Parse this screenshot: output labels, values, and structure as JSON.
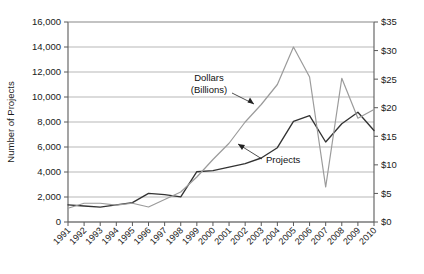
{
  "chart_data": {
    "type": "line",
    "title": "",
    "xlabel": "",
    "ylabel": "Number of Projects",
    "y2label": "",
    "grid": true,
    "legend_position": "inline-annotations",
    "x": [
      1991,
      1992,
      1993,
      1994,
      1995,
      1996,
      1997,
      1998,
      1999,
      2000,
      2001,
      2002,
      2003,
      2004,
      2005,
      2006,
      2007,
      2008,
      2009,
      2010
    ],
    "xtick_labels": [
      "1991",
      "1992",
      "1993",
      "1994",
      "1995",
      "1996",
      "1997",
      "1998",
      "1999",
      "2000",
      "2001",
      "2002",
      "2003",
      "2004",
      "2005",
      "2006",
      "2007",
      "2008",
      "2009",
      "2010"
    ],
    "ylim": [
      0,
      16000
    ],
    "ytick_labels": [
      "0",
      "2,000",
      "4,000",
      "6,000",
      "8,000",
      "10,000",
      "12,000",
      "14,000",
      "16,000"
    ],
    "ytick_values": [
      0,
      2000,
      4000,
      6000,
      8000,
      10000,
      12000,
      14000,
      16000
    ],
    "y2lim": [
      0,
      35
    ],
    "y2tick_labels": [
      "$0",
      "$5",
      "$10",
      "$15",
      "$20",
      "$25",
      "$30",
      "$35"
    ],
    "y2tick_values": [
      0,
      5,
      10,
      15,
      20,
      25,
      30,
      35
    ],
    "series": [
      {
        "name": "Dollars (Billions)",
        "axis": "right",
        "color": "#333333",
        "values": [
          3.0,
          2.8,
          2.6,
          3.0,
          3.4,
          5.0,
          4.8,
          4.4,
          8.8,
          9.0,
          9.6,
          10.2,
          11.2,
          13.0,
          17.6,
          18.6,
          14.0,
          17.2,
          19.2,
          16.0
        ]
      },
      {
        "name": "Projects",
        "axis": "left",
        "color": "#9b9b9b",
        "values": [
          1100,
          1500,
          1500,
          1350,
          1500,
          1200,
          1800,
          2400,
          3600,
          5000,
          6300,
          8000,
          9400,
          11000,
          14000,
          11600,
          2800,
          11500,
          8300,
          9000
        ]
      }
    ],
    "annotations": [
      {
        "name": "dollars-label",
        "text_lines": [
          "Dollars",
          "(Billions)"
        ],
        "points_to_series": "Dollars (Billions)"
      },
      {
        "name": "projects-label",
        "text_lines": [
          "Projects"
        ],
        "points_to_series": "Projects"
      }
    ]
  }
}
